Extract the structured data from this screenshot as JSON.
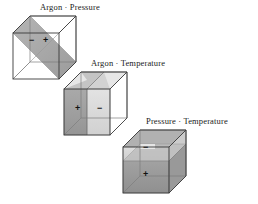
{
  "figure": {
    "type": "diagram",
    "background_color": "#ffffff",
    "line_color": "#3a3a3a",
    "cubes": [
      {
        "id": "cube-argon-pressure",
        "label": "Argon · Pressure",
        "label_position": {
          "x": 40,
          "y": 3
        },
        "origin": {
          "x": 13,
          "y": 16
        },
        "size": 46,
        "depth": 17,
        "interaction_type": "diagonal-cross",
        "plane_light_color": "#e3e3e3",
        "plane_dark_color": "#9a9a9a",
        "signs": [
          {
            "symbol": "−",
            "x": 30,
            "y": 40
          },
          {
            "symbol": "+",
            "x": 45,
            "y": 40
          }
        ]
      },
      {
        "id": "cube-argon-temperature",
        "label": "Argon · Temperature",
        "label_position": {
          "x": 91,
          "y": 59
        },
        "origin": {
          "x": 64,
          "y": 72
        },
        "size": 46,
        "depth": 17,
        "interaction_type": "vertical-split",
        "plane_light_color": "#d8d8d8",
        "plane_dark_color": "#8e8e8e",
        "signs": [
          {
            "symbol": "+",
            "x": 78,
            "y": 98
          },
          {
            "symbol": "−",
            "x": 99,
            "y": 98
          }
        ]
      },
      {
        "id": "cube-pressure-temperature",
        "label": "Pressure · Temperature",
        "label_position": {
          "x": 146,
          "y": 117
        },
        "origin": {
          "x": 123,
          "y": 130
        },
        "size": 46,
        "depth": 17,
        "interaction_type": "horizontal-split",
        "plane_light_color": "#d5d5d5",
        "plane_dark_color": "#8a8a8a",
        "signs": [
          {
            "symbol": "−",
            "x": 147,
            "y": 147
          },
          {
            "symbol": "+",
            "x": 147,
            "y": 172
          }
        ]
      }
    ]
  }
}
